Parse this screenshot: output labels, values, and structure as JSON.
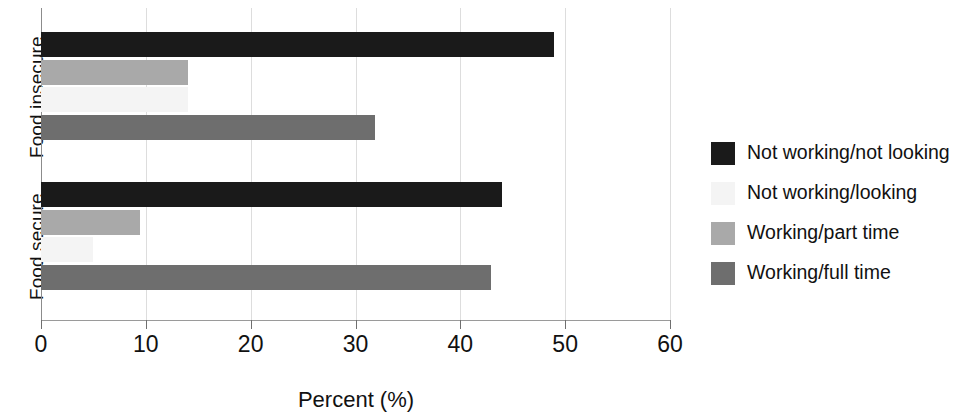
{
  "chart_data": {
    "type": "bar",
    "orientation": "horizontal",
    "title": "",
    "xlabel": "Percent (%)",
    "ylabel": "",
    "xlim": [
      0,
      60
    ],
    "xticks": [
      0,
      10,
      20,
      30,
      40,
      50,
      60
    ],
    "xtick_labels": [
      "0",
      "10",
      "20",
      "30",
      "40",
      "50",
      "60"
    ],
    "grid": true,
    "grid_axis": "x",
    "legend_position": "right",
    "categories": [
      "Food insecure",
      "Food secure"
    ],
    "series": [
      {
        "name": "Not working/not looking",
        "color": "#1a1a1a",
        "values": [
          48.9,
          44.0
        ]
      },
      {
        "name": "Not working/looking",
        "color": "#f4f4f4",
        "values": [
          14.0,
          5.0
        ]
      },
      {
        "name": "Working/part time",
        "color": "#a9a9a9",
        "values": [
          14.0,
          9.4
        ]
      },
      {
        "name": "Working/full time",
        "color": "#6e6e6e",
        "values": [
          31.9,
          42.9
        ]
      }
    ]
  },
  "axis": {
    "y_group_labels": {
      "top": "Food insecure",
      "bottom": "Food secure"
    },
    "x_title": "Percent (%)",
    "x_tick_labels": [
      "0",
      "10",
      "20",
      "30",
      "40",
      "50",
      "60"
    ]
  },
  "legend": {
    "items": [
      {
        "label": "Not working/not looking",
        "color": "#1a1a1a"
      },
      {
        "label": "Not working/looking",
        "color": "#f4f4f4"
      },
      {
        "label": "Working/part time",
        "color": "#a9a9a9"
      },
      {
        "label": "Working/full time",
        "color": "#6e6e6e"
      }
    ]
  },
  "colors": {
    "background": "#ffffff",
    "axis": "#6f6f6f",
    "grid": "#dddddd",
    "text": "#111111"
  }
}
